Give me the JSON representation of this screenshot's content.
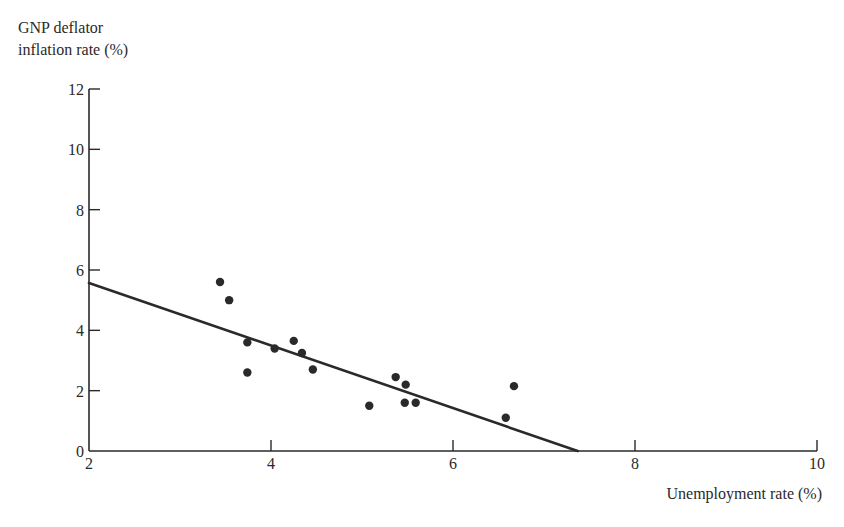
{
  "chart_data": {
    "type": "scatter",
    "title": "",
    "ylabel_lines": [
      "GNP deflator",
      "inflation rate (%)"
    ],
    "xlabel": "Unemployment rate (%)",
    "xlim": [
      2,
      10
    ],
    "ylim": [
      0,
      12
    ],
    "xticks": [
      2,
      4,
      6,
      8,
      10
    ],
    "yticks": [
      0,
      2,
      4,
      6,
      8,
      10,
      12
    ],
    "grid": false,
    "legend": null,
    "points": [
      {
        "x": 3.44,
        "y": 5.6
      },
      {
        "x": 3.54,
        "y": 5.0
      },
      {
        "x": 3.74,
        "y": 3.6
      },
      {
        "x": 3.74,
        "y": 2.6
      },
      {
        "x": 4.04,
        "y": 3.4
      },
      {
        "x": 4.25,
        "y": 3.65
      },
      {
        "x": 4.34,
        "y": 3.25
      },
      {
        "x": 4.46,
        "y": 2.7
      },
      {
        "x": 5.08,
        "y": 1.5
      },
      {
        "x": 5.37,
        "y": 2.45
      },
      {
        "x": 5.48,
        "y": 2.2
      },
      {
        "x": 5.47,
        "y": 1.6
      },
      {
        "x": 5.59,
        "y": 1.6
      },
      {
        "x": 6.67,
        "y": 2.15
      },
      {
        "x": 6.58,
        "y": 1.1
      }
    ],
    "fit_line": {
      "x": [
        2,
        7.37
      ],
      "y": [
        5.57,
        0
      ]
    }
  },
  "colors": {
    "ink": "#2a2a2a",
    "background": "#ffffff"
  }
}
